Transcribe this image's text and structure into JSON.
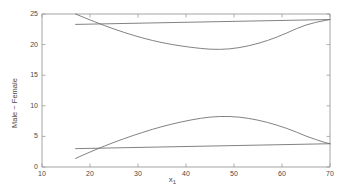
{
  "chart_data": {
    "type": "line",
    "title": "",
    "subtitle": "",
    "xlabel": "x₁",
    "xlabel_base": "x",
    "xlabel_sub": "1",
    "ylabel": "Male − Female",
    "xlim": [
      10,
      70
    ],
    "ylim": [
      0,
      25
    ],
    "xticks": [
      10,
      20,
      30,
      40,
      50,
      60,
      70
    ],
    "yticks": [
      0,
      5,
      10,
      15,
      20,
      25
    ],
    "xtick_labels": [
      "10",
      "20",
      "30",
      "40",
      "50",
      "60",
      "70"
    ],
    "ytick_labels": [
      "0",
      "5",
      "10",
      "15",
      "20",
      "25"
    ],
    "grid": false,
    "legend": "none",
    "line_color": "#6b6b6b",
    "axis_color": "#9a9a9a",
    "background": "#ffffff",
    "x_data_range": [
      17,
      70
    ],
    "series": [
      {
        "name": "upper-curved-band",
        "comment": "curved upper bound: starts at 25.0 at x=17, minimum ~19.2 near x=44, rises to ~24.1 at x=70",
        "x": [
          17,
          19,
          21,
          23,
          25,
          27,
          29,
          31,
          33,
          35,
          37,
          39,
          41,
          43,
          45,
          47,
          49,
          51,
          53,
          55,
          57,
          59,
          61,
          63,
          65,
          67,
          69,
          70
        ],
        "values": [
          25.0,
          24.35,
          23.72,
          23.12,
          22.55,
          22.02,
          21.53,
          21.08,
          20.68,
          20.33,
          20.03,
          19.78,
          19.56,
          19.38,
          19.25,
          19.22,
          19.3,
          19.5,
          19.8,
          20.2,
          20.68,
          21.25,
          21.9,
          22.6,
          23.2,
          23.62,
          23.95,
          24.1
        ]
      },
      {
        "name": "upper-straight-band",
        "comment": "nearly flat upper line from 23.3 at x=17 rising slightly to 24.1 at x=70",
        "x": [
          17,
          70
        ],
        "values": [
          23.3,
          24.1
        ]
      },
      {
        "name": "lower-curved-band",
        "comment": "curved lower bound: starts at 1.4 at x=17, peaks ~8.25 near x=47, falls to ~3.8 at x=70",
        "x": [
          17,
          19,
          21,
          23,
          25,
          27,
          29,
          31,
          33,
          35,
          37,
          39,
          41,
          43,
          45,
          47,
          49,
          51,
          53,
          55,
          57,
          59,
          61,
          63,
          65,
          67,
          69,
          70
        ],
        "values": [
          1.4,
          2.1,
          2.78,
          3.42,
          4.03,
          4.6,
          5.15,
          5.66,
          6.15,
          6.6,
          7.0,
          7.36,
          7.68,
          7.95,
          8.15,
          8.25,
          8.25,
          8.15,
          7.95,
          7.65,
          7.28,
          6.82,
          6.3,
          5.7,
          5.05,
          4.5,
          4.0,
          3.8
        ]
      },
      {
        "name": "lower-straight-band",
        "comment": "nearly flat lower line from 3.0 at x=17 rising slightly to 3.8 at x=70",
        "x": [
          17,
          70
        ],
        "values": [
          3.0,
          3.8
        ]
      }
    ]
  },
  "axes": {
    "y_label_text": "Male − Female",
    "x_label_base": "x",
    "x_label_sub": "1"
  }
}
